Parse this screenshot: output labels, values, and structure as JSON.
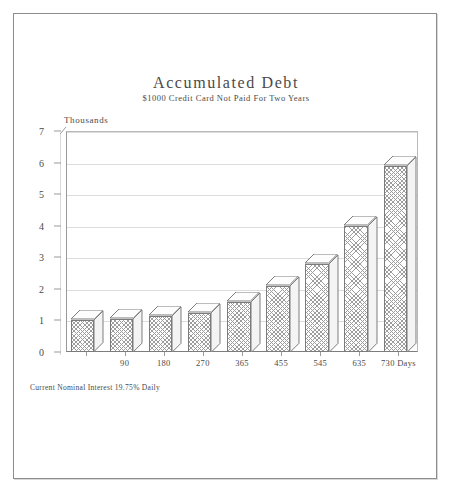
{
  "chart_data": {
    "type": "bar",
    "title": "Accumulated Debt",
    "subtitle": "$1000 Credit Card Not Paid For Two Years",
    "axis_unit_label": "Thousands",
    "xlabel": "",
    "ylabel": "Thousands",
    "categories": [
      "",
      "90",
      "180",
      "270",
      "365",
      "455",
      "545",
      "635",
      "730 Days"
    ],
    "values": [
      1.0,
      1.05,
      1.15,
      1.25,
      1.6,
      2.1,
      2.8,
      4.0,
      5.9
    ],
    "ylim": [
      0,
      7
    ],
    "ytick_labels": [
      "0",
      "1",
      "2",
      "3",
      "4",
      "5",
      "6",
      "7"
    ],
    "ytick_values": [
      0,
      1,
      2,
      3,
      4,
      5,
      6,
      7
    ],
    "grid": true,
    "legend": false,
    "footnote": "Current Nominal Interest 19.75% Daily",
    "style": {
      "bar_fill": "#ffffff",
      "bar_hatch": "#9d9d9d",
      "bar_outline": "#7b7b7b",
      "gridline_color": "#dcdcdc",
      "axis_color": "#9a9a9a",
      "text_color": "#4a4a4a",
      "background": "#ffffff"
    }
  },
  "frame": {
    "border_color": "#8d8d8d"
  }
}
